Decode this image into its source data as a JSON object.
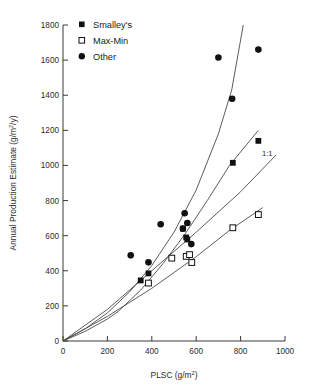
{
  "chart_data": {
    "type": "scatter",
    "title": "",
    "xlabel": "PLSC (g/m2)",
    "ylabel": "Annual Production Estimate (g/m2/y)",
    "xlabel_parts": {
      "base": "PLSC (g/m",
      "sup": "2",
      "tail": ")"
    },
    "ylabel_parts": {
      "base": "Annual Production Estimate (g/m",
      "sup": "2",
      "tail": "/y)"
    },
    "xlim": [
      0,
      1000
    ],
    "ylim": [
      0,
      1800
    ],
    "xticks": [
      0,
      200,
      400,
      600,
      800,
      1000
    ],
    "yticks": [
      0,
      200,
      400,
      600,
      800,
      1000,
      1200,
      1400,
      1600,
      1800
    ],
    "xtick_labels": [
      "0",
      "200",
      "400",
      "600",
      "800",
      "1000"
    ],
    "ytick_labels": [
      "0",
      "200",
      "400",
      "600",
      "800",
      "1000",
      "1200",
      "1400",
      "1600",
      "1800"
    ],
    "grid": false,
    "legend_position": "top-left",
    "series": [
      {
        "name": "Smalley's",
        "marker": "filled-square",
        "color": "#111111",
        "points": [
          {
            "x": 350,
            "y": 345
          },
          {
            "x": 385,
            "y": 385
          },
          {
            "x": 540,
            "y": 640
          },
          {
            "x": 555,
            "y": 590
          },
          {
            "x": 560,
            "y": 578
          },
          {
            "x": 765,
            "y": 1015
          },
          {
            "x": 880,
            "y": 1140
          }
        ]
      },
      {
        "name": "Max-Min",
        "marker": "open-square",
        "color": "#111111",
        "points": [
          {
            "x": 385,
            "y": 330
          },
          {
            "x": 490,
            "y": 472
          },
          {
            "x": 555,
            "y": 482
          },
          {
            "x": 570,
            "y": 492
          },
          {
            "x": 580,
            "y": 447
          },
          {
            "x": 765,
            "y": 645
          },
          {
            "x": 880,
            "y": 720
          }
        ]
      },
      {
        "name": "Other",
        "marker": "filled-circle",
        "color": "#111111",
        "points": [
          {
            "x": 305,
            "y": 488
          },
          {
            "x": 385,
            "y": 448
          },
          {
            "x": 440,
            "y": 665
          },
          {
            "x": 540,
            "y": 640
          },
          {
            "x": 548,
            "y": 728
          },
          {
            "x": 560,
            "y": 672
          },
          {
            "x": 578,
            "y": 552
          },
          {
            "x": 700,
            "y": 1615
          },
          {
            "x": 762,
            "y": 1380
          },
          {
            "x": 880,
            "y": 1660
          }
        ]
      }
    ],
    "annotations": [
      {
        "text": "1:1",
        "x": 905,
        "y": 1060
      }
    ],
    "fit_curves": [
      {
        "name": "other-fit",
        "points": [
          [
            0,
            0
          ],
          [
            100,
            70
          ],
          [
            200,
            160
          ],
          [
            300,
            280
          ],
          [
            400,
            430
          ],
          [
            500,
            620
          ],
          [
            600,
            860
          ],
          [
            700,
            1180
          ],
          [
            760,
            1430
          ],
          [
            812,
            1800
          ]
        ]
      },
      {
        "name": "smalleys-fit",
        "points": [
          [
            0,
            0
          ],
          [
            100,
            55
          ],
          [
            200,
            125
          ],
          [
            250,
            170
          ],
          [
            350,
            290
          ],
          [
            450,
            440
          ],
          [
            550,
            610
          ],
          [
            650,
            800
          ],
          [
            750,
            1000
          ],
          [
            880,
            1200
          ]
        ]
      },
      {
        "name": "one-to-one-line",
        "points": [
          [
            0,
            0
          ],
          [
            200,
            180
          ],
          [
            400,
            400
          ],
          [
            600,
            620
          ],
          [
            800,
            850
          ],
          [
            960,
            1060
          ]
        ]
      },
      {
        "name": "maxmin-fit",
        "points": [
          [
            0,
            0
          ],
          [
            200,
            140
          ],
          [
            400,
            300
          ],
          [
            600,
            480
          ],
          [
            750,
            630
          ],
          [
            900,
            760
          ]
        ]
      }
    ]
  },
  "legend": {
    "items": [
      {
        "label": "Smalley's",
        "marker": "filled-square"
      },
      {
        "label": "Max-Min",
        "marker": "open-square"
      },
      {
        "label": "Other",
        "marker": "filled-circle"
      }
    ]
  }
}
